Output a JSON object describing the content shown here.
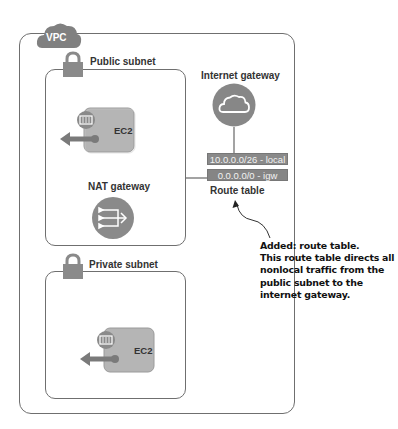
{
  "diagram": {
    "vpc": {
      "label": "VPC",
      "icon": "cloud-icon"
    },
    "public_subnet": {
      "label": "Public subnet",
      "icon": "lock-icon",
      "ec2": {
        "label": "EC2",
        "icon": "ec2-instance-icon"
      },
      "nat_gateway": {
        "label": "NAT gateway",
        "icon": "nat-gateway-icon"
      }
    },
    "private_subnet": {
      "label": "Private subnet",
      "icon": "lock-icon",
      "ec2": {
        "label": "EC2",
        "icon": "ec2-instance-icon"
      }
    },
    "internet_gateway": {
      "label": "Internet gateway",
      "icon": "cloud-icon"
    },
    "route_table": {
      "label": "Route table",
      "routes": [
        {
          "text": "10.0.0.0/26 - local"
        },
        {
          "text": "0.0.0.0/0 - igw"
        }
      ]
    },
    "annotation": {
      "lines": [
        "Added: route table.",
        "This route table directs all",
        "nonlocal traffic from the",
        "public subnet to the",
        "internet gateway."
      ]
    },
    "colors": {
      "icon_gray": "#8c8c8c",
      "icon_dark": "#6e6e6e",
      "border": "#6f6f6f",
      "text": "#333333"
    }
  }
}
